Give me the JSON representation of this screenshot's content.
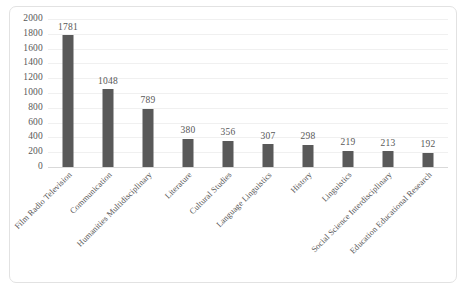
{
  "chart_data": {
    "type": "bar",
    "title": "",
    "xlabel": "",
    "ylabel": "",
    "ylim": [
      0,
      2000
    ],
    "yticks": [
      0,
      200,
      400,
      600,
      800,
      1000,
      1200,
      1400,
      1600,
      1800,
      2000
    ],
    "grid": true,
    "legend": false,
    "orientation": "vertical",
    "bar_color": "#595959",
    "gridline_color": "#f0f0f0",
    "axis_color": "#d9d9d9",
    "data_labels": true,
    "categories": [
      "Film Radio Television",
      "Communication",
      "Humanities Multidisciplinary",
      "Literature",
      "Cultural Studies",
      "Language Linguistics",
      "History",
      "Linguistics",
      "Social Science Interdisciplinary",
      "Education Educational Research"
    ],
    "values": [
      1781,
      1048,
      789,
      380,
      356,
      307,
      298,
      219,
      213,
      192
    ]
  },
  "caption": {
    "text": "",
    "visible_fragment": ""
  }
}
